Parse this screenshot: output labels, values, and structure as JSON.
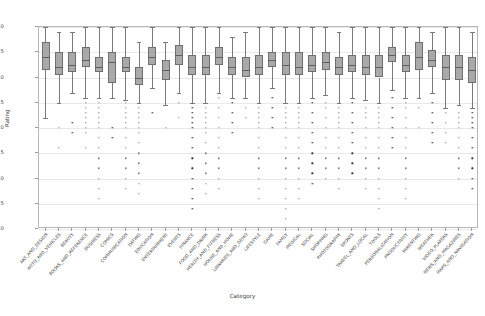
{
  "chart_data": {
    "type": "box",
    "title": "",
    "xlabel": "Category",
    "ylabel": "Rating",
    "ylim": [
      1.0,
      5.0
    ],
    "yticks": [
      "1.0",
      "1.5",
      "2.0",
      "2.5",
      "3.0",
      "3.5",
      "4.0",
      "4.5",
      "5.0"
    ],
    "ytick_values": [
      1.0,
      1.5,
      2.0,
      2.5,
      3.0,
      3.5,
      4.0,
      4.5,
      5.0
    ],
    "grid": true,
    "legend": "none",
    "xtick_rotation": -48,
    "categories": [
      "ART_AND_DESIGN",
      "AUTO_AND_VEHICLES",
      "BEAUTY",
      "BOOKS_AND_REFERENCE",
      "BUSINESS",
      "COMICS",
      "COMMUNICATION",
      "DATING",
      "EDUCATION",
      "ENTERTAINMENT",
      "EVENTS",
      "FINANCE",
      "FOOD_AND_DRINK",
      "HEALTH_AND_FITNESS",
      "HOUSE_AND_HOME",
      "LIBRARIES_AND_DEMO",
      "LIFESTYLE",
      "GAME",
      "FAMILY",
      "MEDICAL",
      "SOCIAL",
      "SHOPPING",
      "PHOTOGRAPHY",
      "SPORTS",
      "TRAVEL_AND_LOCAL",
      "TOOLS",
      "PERSONALIZATION",
      "PRODUCTIVITY",
      "PARENTING",
      "WEATHER",
      "VIDEO_PLAYERS",
      "NEWS_AND_MAGAZINES",
      "MAPS_AND_NAVIGATION"
    ],
    "boxes": [
      {
        "category": "ART_AND_DESIGN",
        "whislo": 3.2,
        "q1": 4.15,
        "med": 4.4,
        "q3": 4.7,
        "whishi": 5.0,
        "outliers": []
      },
      {
        "category": "AUTO_AND_VEHICLES",
        "whislo": 3.5,
        "q1": 4.05,
        "med": 4.2,
        "q3": 4.5,
        "whishi": 4.9,
        "outliers": [
          3.0,
          2.6
        ]
      },
      {
        "category": "BEAUTY",
        "whislo": 3.7,
        "q1": 4.1,
        "med": 4.25,
        "q3": 4.5,
        "whishi": 4.9,
        "outliers": [
          3.1,
          2.9
        ]
      },
      {
        "category": "BOOKS_AND_REFERENCE",
        "whislo": 3.6,
        "q1": 4.2,
        "med": 4.35,
        "q3": 4.6,
        "whishi": 5.0,
        "outliers": [
          3.5,
          3.4,
          3.3,
          3.2,
          3.1,
          3.0,
          2.9,
          2.6
        ]
      },
      {
        "category": "BUSINESS",
        "whislo": 3.6,
        "q1": 4.1,
        "med": 4.2,
        "q3": 4.4,
        "whishi": 5.0,
        "outliers": [
          3.5,
          3.4,
          3.3,
          3.2,
          3.1,
          3.0,
          2.8,
          2.6,
          2.4,
          2.2,
          2.0,
          1.8,
          1.6
        ]
      },
      {
        "category": "COMICS",
        "whislo": 3.6,
        "q1": 3.9,
        "med": 4.3,
        "q3": 4.5,
        "whishi": 5.0,
        "outliers": [
          3.0,
          2.8
        ]
      },
      {
        "category": "COMMUNICATION",
        "whislo": 3.55,
        "q1": 4.1,
        "med": 4.2,
        "q3": 4.4,
        "whishi": 5.0,
        "outliers": [
          3.5,
          3.4,
          3.3,
          3.2,
          3.1,
          3.0,
          2.8,
          2.6,
          2.4,
          2.2,
          2.0,
          1.8
        ]
      },
      {
        "category": "DATING",
        "whislo": 3.5,
        "q1": 3.85,
        "med": 4.0,
        "q3": 4.2,
        "whishi": 4.7,
        "outliers": [
          3.4,
          3.3,
          3.2,
          3.1,
          3.0,
          2.9,
          2.7,
          2.5,
          2.3,
          2.1,
          1.9,
          1.7
        ]
      },
      {
        "category": "EDUCATION",
        "whislo": 3.8,
        "q1": 4.25,
        "med": 4.4,
        "q3": 4.6,
        "whishi": 5.0,
        "outliers": [
          3.3
        ]
      },
      {
        "category": "ENTERTAINMENT",
        "whislo": 3.45,
        "q1": 3.95,
        "med": 4.15,
        "q3": 4.35,
        "whishi": 4.7,
        "outliers": [
          3.0
        ]
      },
      {
        "category": "EVENTS",
        "whislo": 3.7,
        "q1": 4.25,
        "med": 4.45,
        "q3": 4.65,
        "whishi": 5.0,
        "outliers": [
          3.5,
          3.2
        ]
      },
      {
        "category": "FINANCE",
        "whislo": 3.5,
        "q1": 4.05,
        "med": 4.2,
        "q3": 4.45,
        "whishi": 5.0,
        "outliers": [
          3.4,
          3.3,
          3.2,
          3.1,
          3.0,
          2.8,
          2.6,
          2.4,
          2.2,
          2.0,
          1.8,
          1.6,
          1.4
        ]
      },
      {
        "category": "FOOD_AND_DRINK",
        "whislo": 3.5,
        "q1": 4.05,
        "med": 4.2,
        "q3": 4.45,
        "whishi": 5.0,
        "outliers": [
          3.4,
          3.3,
          3.2,
          3.1,
          3.0,
          2.9,
          2.7,
          2.5,
          2.3,
          2.1,
          1.9,
          1.7
        ]
      },
      {
        "category": "HEALTH_AND_FITNESS",
        "whislo": 3.7,
        "q1": 4.25,
        "med": 4.4,
        "q3": 4.6,
        "whishi": 5.0,
        "outliers": [
          3.6,
          3.4,
          3.2,
          3.0,
          2.8,
          2.6,
          2.4,
          2.2,
          2.0,
          1.8
        ]
      },
      {
        "category": "HOUSE_AND_HOME",
        "whislo": 3.6,
        "q1": 4.05,
        "med": 4.2,
        "q3": 4.4,
        "whishi": 4.8,
        "outliers": [
          3.5,
          3.3,
          3.1,
          2.9
        ]
      },
      {
        "category": "LIBRARIES_AND_DEMO",
        "whislo": 3.6,
        "q1": 4.0,
        "med": 4.15,
        "q3": 4.4,
        "whishi": 4.9,
        "outliers": [
          3.4,
          3.2
        ]
      },
      {
        "category": "LIFESTYLE",
        "whislo": 3.5,
        "q1": 4.05,
        "med": 4.2,
        "q3": 4.45,
        "whishi": 5.0,
        "outliers": [
          3.4,
          3.3,
          3.2,
          3.1,
          3.0,
          2.8,
          2.6,
          2.4,
          2.2,
          2.0,
          1.8,
          1.6
        ]
      },
      {
        "category": "GAME",
        "whislo": 3.8,
        "q1": 4.2,
        "med": 4.35,
        "q3": 4.5,
        "whishi": 5.0,
        "outliers": [
          3.6,
          3.4,
          3.2,
          3.0
        ]
      },
      {
        "category": "FAMILY",
        "whislo": 3.5,
        "q1": 4.05,
        "med": 4.25,
        "q3": 4.5,
        "whishi": 5.0,
        "outliers": [
          3.4,
          3.3,
          3.2,
          3.1,
          3.0,
          2.8,
          2.6,
          2.4,
          2.2,
          2.0,
          1.8,
          1.6,
          1.4,
          1.2
        ]
      },
      {
        "category": "MEDICAL",
        "whislo": 3.5,
        "q1": 4.05,
        "med": 4.2,
        "q3": 4.5,
        "whishi": 5.0,
        "outliers": [
          3.4,
          3.3,
          3.2,
          3.1,
          3.0,
          2.8,
          2.6,
          2.4,
          2.2,
          2.0,
          1.8,
          1.6
        ]
      },
      {
        "category": "SOCIAL",
        "whislo": 3.6,
        "q1": 4.1,
        "med": 4.25,
        "q3": 4.45,
        "whishi": 5.0,
        "outliers": [
          3.5,
          3.3,
          3.1,
          2.9,
          2.7,
          2.5,
          2.3,
          2.1,
          1.9
        ]
      },
      {
        "category": "SHOPPING",
        "whislo": 3.65,
        "q1": 4.15,
        "med": 4.3,
        "q3": 4.5,
        "whishi": 5.0,
        "outliers": [
          3.5,
          3.4,
          3.2,
          3.0,
          2.8,
          2.6,
          2.4,
          2.2,
          2.0
        ]
      },
      {
        "category": "PHOTOGRAPHY",
        "whislo": 3.5,
        "q1": 4.05,
        "med": 4.2,
        "q3": 4.4,
        "whishi": 4.9,
        "outliers": [
          3.4,
          3.3,
          3.2,
          3.1,
          3.0,
          2.8,
          2.6,
          2.4,
          2.2,
          2.0,
          1.8
        ]
      },
      {
        "category": "SPORTS",
        "whislo": 3.6,
        "q1": 4.1,
        "med": 4.25,
        "q3": 4.45,
        "whishi": 5.0,
        "outliers": [
          3.5,
          3.3,
          3.1,
          2.9,
          2.7,
          2.5,
          2.3,
          2.1
        ]
      },
      {
        "category": "TRAVEL_AND_LOCAL",
        "whislo": 3.55,
        "q1": 4.05,
        "med": 4.2,
        "q3": 4.45,
        "whishi": 5.0,
        "outliers": [
          3.4,
          3.3,
          3.2,
          3.0,
          2.8,
          2.6,
          2.4,
          2.2,
          2.0,
          1.8
        ]
      },
      {
        "category": "TOOLS",
        "whislo": 3.5,
        "q1": 4.0,
        "med": 4.2,
        "q3": 4.45,
        "whishi": 5.0,
        "outliers": [
          3.4,
          3.3,
          3.2,
          3.1,
          3.0,
          2.8,
          2.6,
          2.4,
          2.2,
          2.0,
          1.8,
          1.6,
          1.4
        ]
      },
      {
        "category": "PERSONALIZATION",
        "whislo": 3.75,
        "q1": 4.3,
        "med": 4.45,
        "q3": 4.6,
        "whishi": 5.0,
        "outliers": [
          3.6,
          3.4,
          3.2,
          3.0,
          2.8,
          2.6
        ]
      },
      {
        "category": "PRODUCTIVITY",
        "whislo": 3.6,
        "q1": 4.1,
        "med": 4.25,
        "q3": 4.45,
        "whishi": 5.0,
        "outliers": [
          3.5,
          3.4,
          3.2,
          3.0,
          2.8,
          2.6,
          2.4,
          2.2,
          2.0,
          1.8,
          1.6
        ]
      },
      {
        "category": "PARENTING",
        "whislo": 3.6,
        "q1": 4.15,
        "med": 4.4,
        "q3": 4.7,
        "whishi": 5.0,
        "outliers": [
          3.4,
          3.0
        ]
      },
      {
        "category": "WEATHER",
        "whislo": 3.7,
        "q1": 4.2,
        "med": 4.35,
        "q3": 4.55,
        "whishi": 4.9,
        "outliers": [
          3.5,
          3.3,
          3.1,
          2.9,
          2.7
        ]
      },
      {
        "category": "VIDEO_PLAYERS",
        "whislo": 3.4,
        "q1": 3.95,
        "med": 4.2,
        "q3": 4.45,
        "whishi": 5.0,
        "outliers": [
          3.3,
          3.1,
          2.9,
          2.7
        ]
      },
      {
        "category": "NEWS_AND_MAGAZINES",
        "whislo": 3.45,
        "q1": 3.95,
        "med": 4.2,
        "q3": 4.45,
        "whishi": 5.0,
        "outliers": [
          3.3,
          3.2,
          3.1,
          3.0,
          2.8,
          2.6,
          2.4,
          2.2,
          2.0
        ]
      },
      {
        "category": "MAPS_AND_NAVIGATION",
        "whislo": 3.4,
        "q1": 3.9,
        "med": 4.15,
        "q3": 4.4,
        "whishi": 4.9,
        "outliers": [
          3.3,
          3.2,
          3.1,
          3.0,
          2.8,
          2.6,
          2.4,
          2.2,
          2.0,
          1.8
        ]
      }
    ],
    "colors": {
      "box_face": "#a9a9a9",
      "box_edge": "#6f6f6f",
      "median": "#5e5e5e",
      "whisker": "#7a7a7a",
      "outlier": "#2e2e2e",
      "grid": "#e9e9e9",
      "background": "#ffffff"
    }
  }
}
